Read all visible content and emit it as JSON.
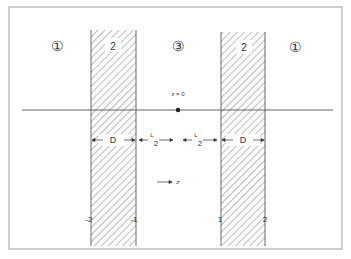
{
  "diagram": {
    "regions": [
      {
        "id": "region-1-left",
        "label": "①"
      },
      {
        "id": "slab-left",
        "label": "2"
      },
      {
        "id": "region-3-center",
        "label": "③"
      },
      {
        "id": "slab-right",
        "label": "2"
      },
      {
        "id": "region-1-right",
        "label": "①"
      }
    ],
    "origin_label": "z = 0",
    "dimension_labels": {
      "slab_width_left": "D",
      "gap_left_L": "L",
      "gap_left_sub": "2",
      "gap_right_L": "L",
      "gap_right_sub": "2",
      "slab_width_right": "D"
    },
    "axis_direction_label": "z",
    "boundary_labels": [
      "-2",
      "-1",
      "1",
      "2"
    ]
  }
}
